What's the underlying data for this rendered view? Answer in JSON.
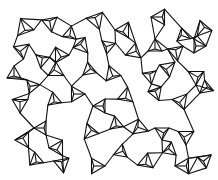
{
  "artwork": {
    "description": "Black line-art pattern of interlocking wireframe tetrahedra joined by straight connector lines on a white background",
    "motif": "wireframe-tetrahedron",
    "line_color": "#111111",
    "background_color": "#ffffff"
  }
}
